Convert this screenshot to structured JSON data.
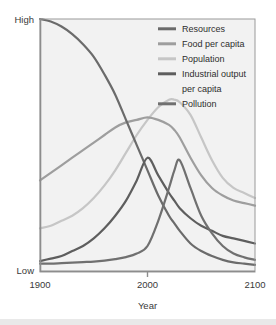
{
  "figure": {
    "background": "#ffffff",
    "plot_background": "#f2f2f2",
    "plot_border_color": "#9a9a9a"
  },
  "axis": {
    "y_top_label": "High",
    "y_bottom_label": "Low",
    "x_label": "Year",
    "x_ticks": [
      "1900",
      "2000",
      "2100"
    ]
  },
  "legend": {
    "items": [
      {
        "label": "Resources",
        "color": "#6b6b6b"
      },
      {
        "label": "Food per capita",
        "color": "#9e9e9e"
      },
      {
        "label": "Population",
        "color": "#c6c6c6"
      },
      {
        "label": "Industrial output",
        "label2": "per capita",
        "color": "#5e5e5e"
      },
      {
        "label": "Pollution",
        "color": "#707070"
      }
    ]
  },
  "chart_data": {
    "type": "line",
    "title": "",
    "subtitle": "",
    "xlabel": "Year",
    "ylabel": "",
    "xlim": [
      1900,
      2100
    ],
    "ylim": [
      0,
      100
    ],
    "ytick_labels": [
      "Low",
      "High"
    ],
    "xtick_labels": [
      "1900",
      "2000",
      "2100"
    ],
    "grid": false,
    "legend_position": "top-right",
    "x": [
      1900,
      1910,
      1920,
      1930,
      1940,
      1950,
      1960,
      1970,
      1980,
      1990,
      2000,
      2010,
      2020,
      2025,
      2030,
      2040,
      2050,
      2060,
      2070,
      2080,
      2090,
      2100
    ],
    "series": [
      {
        "name": "Resources",
        "color": "#6b6b6b",
        "values": [
          100,
          99,
          97,
          94,
          90,
          85,
          78,
          70,
          60,
          50,
          40,
          30,
          22,
          19,
          16,
          11,
          8,
          6,
          4.5,
          3.5,
          3,
          2.5
        ]
      },
      {
        "name": "Food per capita",
        "color": "#9e9e9e",
        "values": [
          36,
          39,
          42,
          45,
          48,
          51,
          54,
          57,
          59,
          60,
          61,
          60,
          58,
          56,
          53,
          45,
          38,
          33,
          30,
          28,
          27,
          26
        ]
      },
      {
        "name": "Population",
        "color": "#c6c6c6",
        "values": [
          17,
          18,
          20,
          22,
          25,
          29,
          34,
          40,
          47,
          54,
          60,
          65,
          68,
          68,
          67,
          62,
          53,
          44,
          37,
          33,
          31,
          29
        ]
      },
      {
        "name": "Industrial output per capita",
        "color": "#5e5e5e",
        "values": [
          4,
          5,
          6,
          8,
          10,
          13,
          17,
          22,
          28,
          36,
          45,
          38,
          31,
          28,
          25,
          21,
          18,
          16,
          14,
          13,
          12,
          11
        ]
      },
      {
        "name": "Pollution",
        "color": "#707070",
        "values": [
          3,
          3,
          3.2,
          3.4,
          3.6,
          3.8,
          4.2,
          4.8,
          5.6,
          7,
          10,
          20,
          33,
          40,
          44,
          33,
          22,
          15,
          10,
          7,
          5.5,
          4.5
        ]
      }
    ]
  }
}
